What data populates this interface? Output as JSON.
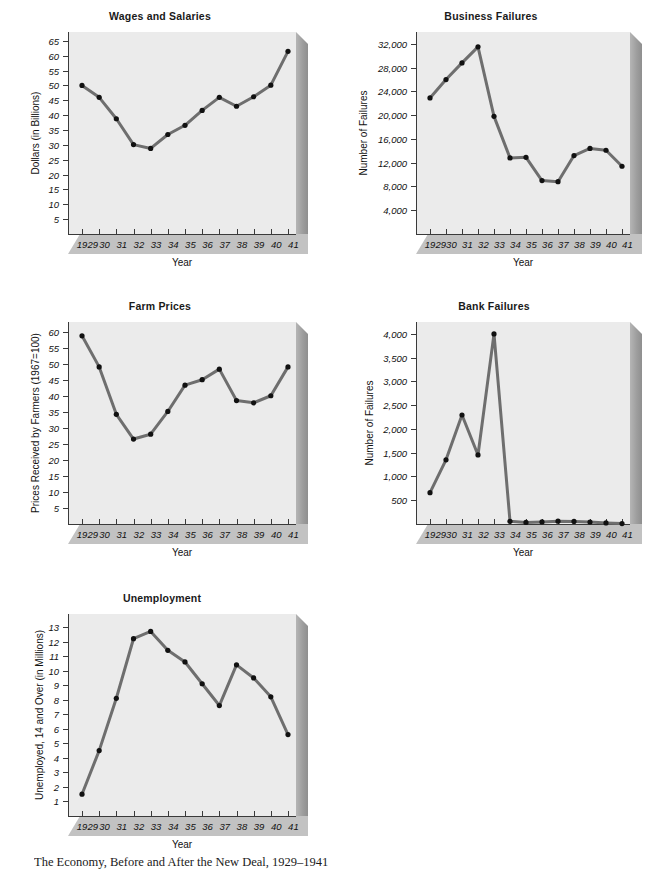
{
  "figure": {
    "caption": "The Economy, Before and After the New Deal, 1929–1941",
    "shared_xlabel": "Year",
    "shared_categories": [
      "1929",
      "30",
      "31",
      "32",
      "33",
      "34",
      "35",
      "36",
      "37",
      "38",
      "39",
      "40",
      "41"
    ],
    "colors": {
      "plot_face": "#ebebeb",
      "floor": "#c4c4c4",
      "wall": "#a5a5a5",
      "line": "#6e6e6e",
      "marker": "#111111",
      "axis": "#3a3a3a",
      "page": "#ffffff"
    }
  },
  "chart_data": [
    {
      "id": "wages-and-salaries",
      "type": "line",
      "title": "Wages and Salaries",
      "xlabel": "Year",
      "ylabel": "Dollars (in Billions)",
      "categories": [
        "1929",
        "30",
        "31",
        "32",
        "33",
        "34",
        "35",
        "36",
        "37",
        "38",
        "39",
        "40",
        "41"
      ],
      "x": [
        1929,
        1930,
        1931,
        1932,
        1933,
        1934,
        1935,
        1936,
        1937,
        1938,
        1939,
        1940,
        1941
      ],
      "values": [
        50.0,
        46.0,
        38.8,
        30.1,
        28.8,
        33.5,
        36.6,
        41.6,
        46.0,
        43.0,
        46.2,
        50.1,
        61.5
      ],
      "yticks": [
        5,
        10,
        15,
        20,
        25,
        30,
        35,
        40,
        45,
        50,
        55,
        60,
        65
      ],
      "ytick_labels": [
        "5",
        "10",
        "15",
        "20",
        "25",
        "30",
        "35",
        "40",
        "45",
        "50",
        "55",
        "60",
        "65"
      ],
      "ylim": [
        0,
        68
      ],
      "grid": false,
      "legend": "none"
    },
    {
      "id": "business-failures",
      "type": "line",
      "title": "Business Failures",
      "xlabel": "Year",
      "ylabel": "Number of Failures",
      "categories": [
        "1929",
        "30",
        "31",
        "32",
        "33",
        "34",
        "35",
        "36",
        "37",
        "38",
        "39",
        "40",
        "41"
      ],
      "x": [
        1929,
        1930,
        1931,
        1932,
        1933,
        1934,
        1935,
        1936,
        1937,
        1938,
        1939,
        1940,
        1941
      ],
      "values": [
        22900,
        26000,
        28800,
        31500,
        19800,
        12800,
        12900,
        9000,
        8800,
        13200,
        14400,
        14100,
        11400
      ],
      "yticks": [
        4000,
        8000,
        12000,
        16000,
        20000,
        24000,
        28000,
        32000
      ],
      "ytick_labels": [
        "4,000",
        "8,000",
        "12,000",
        "16,000",
        "20,000",
        "24,000",
        "28,000",
        "32,000"
      ],
      "ylim": [
        0,
        34000
      ],
      "grid": false,
      "legend": "none"
    },
    {
      "id": "farm-prices",
      "type": "line",
      "title": "Farm Prices",
      "xlabel": "Year",
      "ylabel": "Prices Received by Farmers (1967=100)",
      "categories": [
        "1929",
        "30",
        "31",
        "32",
        "33",
        "34",
        "35",
        "36",
        "37",
        "38",
        "39",
        "40",
        "41"
      ],
      "x": [
        1929,
        1930,
        1931,
        1932,
        1933,
        1934,
        1935,
        1936,
        1937,
        1938,
        1939,
        1940,
        1941
      ],
      "values": [
        58.7,
        49.0,
        34.2,
        26.5,
        28.0,
        35.1,
        43.3,
        45.0,
        48.3,
        38.5,
        37.8,
        40.0,
        49.0
      ],
      "yticks": [
        5,
        10,
        15,
        20,
        25,
        30,
        35,
        40,
        45,
        50,
        55,
        60
      ],
      "ytick_labels": [
        "5",
        "10",
        "15",
        "20",
        "25",
        "30",
        "35",
        "40",
        "45",
        "50",
        "55",
        "60"
      ],
      "ylim": [
        0,
        63
      ],
      "grid": false,
      "legend": "none"
    },
    {
      "id": "bank-failures",
      "type": "line",
      "title": "Bank Failures",
      "xlabel": "Year",
      "ylabel": "Number of Failures",
      "categories": [
        "1929",
        "30",
        "31",
        "32",
        "33",
        "34",
        "35",
        "36",
        "37",
        "38",
        "39",
        "40",
        "41"
      ],
      "x": [
        1929,
        1930,
        1931,
        1932,
        1933,
        1934,
        1935,
        1936,
        1937,
        1938,
        1939,
        1940,
        1941
      ],
      "values": [
        659,
        1350,
        2293,
        1453,
        4000,
        57,
        34,
        44,
        59,
        54,
        42,
        22,
        8
      ],
      "yticks": [
        500,
        1000,
        1500,
        2000,
        2500,
        3000,
        3500,
        4000
      ],
      "ytick_labels": [
        "500",
        "1,000",
        "1,500",
        "2,000",
        "2,500",
        "3,000",
        "3,500",
        "4,000"
      ],
      "ylim": [
        0,
        4250
      ],
      "grid": false,
      "legend": "none"
    },
    {
      "id": "unemployment",
      "type": "line",
      "title": "Unemployment",
      "xlabel": "Year",
      "ylabel": "Unemployed, 14 and Over (in Millions)",
      "categories": [
        "1929",
        "30",
        "31",
        "32",
        "33",
        "34",
        "35",
        "36",
        "37",
        "38",
        "39",
        "40",
        "41"
      ],
      "x": [
        1929,
        1930,
        1931,
        1932,
        1933,
        1934,
        1935,
        1936,
        1937,
        1938,
        1939,
        1940,
        1941
      ],
      "values": [
        1.5,
        4.5,
        8.1,
        12.2,
        12.7,
        11.4,
        10.6,
        9.1,
        7.6,
        10.4,
        9.5,
        8.2,
        5.6
      ],
      "yticks": [
        1,
        2,
        3,
        4,
        5,
        6,
        7,
        8,
        9,
        10,
        11,
        12,
        13
      ],
      "ytick_labels": [
        "1",
        "2",
        "3",
        "4",
        "5",
        "6",
        "7",
        "8",
        "9",
        "10",
        "11",
        "12",
        "13"
      ],
      "ylim": [
        0,
        13.9
      ],
      "grid": false,
      "legend": "none"
    }
  ]
}
